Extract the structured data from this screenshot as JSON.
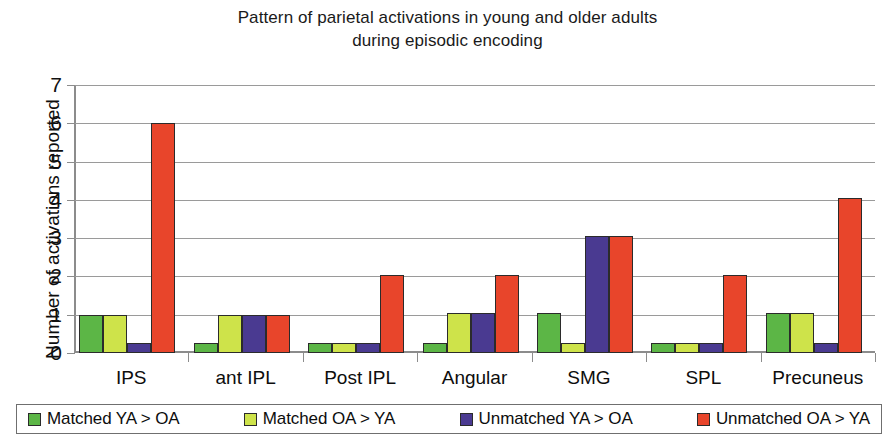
{
  "chart_data": {
    "type": "bar",
    "title": "Pattern of parietal activations in young and older adults\nduring episodic encoding",
    "xlabel": "",
    "ylabel": "Number of activations reported",
    "ylim": [
      0,
      7
    ],
    "yticks": [
      0,
      1,
      2,
      3,
      4,
      5,
      6,
      7
    ],
    "grid": true,
    "legend_position": "bottom",
    "categories": [
      "IPS",
      "ant IPL",
      "Post IPL",
      "Angular",
      "SMG",
      "SPL",
      "Precuneus"
    ],
    "series": [
      {
        "name": "Matched YA > OA",
        "color": "#5cb646",
        "values": [
          1.0,
          0.25,
          0.25,
          0.25,
          1.05,
          0.25,
          1.05
        ]
      },
      {
        "name": "Matched OA > YA",
        "color": "#cee34a",
        "values": [
          1.0,
          1.0,
          0.25,
          1.05,
          0.25,
          0.25,
          1.05
        ]
      },
      {
        "name": "Unmatched YA > OA",
        "color": "#4a3a91",
        "values": [
          0.25,
          1.0,
          0.25,
          1.05,
          3.05,
          0.25,
          0.25
        ]
      },
      {
        "name": "Unmatched OA > YA",
        "color": "#e8452b",
        "values": [
          6.0,
          1.0,
          2.05,
          2.05,
          3.05,
          2.05,
          4.05
        ]
      }
    ]
  },
  "legend": {
    "items": [
      {
        "label": "Matched YA > OA",
        "color": "#5cb646"
      },
      {
        "label": "Matched OA > YA",
        "color": "#cee34a"
      },
      {
        "label": "Unmatched YA > OA",
        "color": "#4a3a91"
      },
      {
        "label": "Unmatched OA > YA",
        "color": "#e8452b"
      }
    ]
  }
}
